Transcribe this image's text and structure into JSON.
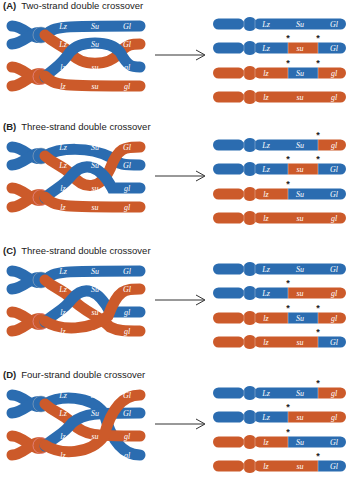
{
  "colors": {
    "blue": "#2b6cb0",
    "orange": "#cc5a2a",
    "arrow": "#333333"
  },
  "panels": [
    {
      "id": "A",
      "letter": "(A)",
      "title": "Two-strand double crossover",
      "top": 0,
      "products": [
        {
          "segments": [
            "blue",
            "blue",
            "blue"
          ],
          "labels": [
            "Lz",
            "Su",
            "Gl"
          ],
          "stars": []
        },
        {
          "segments": [
            "blue",
            "orange",
            "blue"
          ],
          "labels": [
            "Lz",
            "su",
            "Gl"
          ],
          "stars": [
            1,
            2
          ]
        },
        {
          "segments": [
            "orange",
            "blue",
            "orange"
          ],
          "labels": [
            "lz",
            "Su",
            "gl"
          ],
          "stars": [
            1,
            2
          ]
        },
        {
          "segments": [
            "orange",
            "orange",
            "orange"
          ],
          "labels": [
            "lz",
            "su",
            "gl"
          ],
          "stars": []
        }
      ]
    },
    {
      "id": "B",
      "letter": "(B)",
      "title": "Three-strand double crossover",
      "top": 121,
      "products": [
        {
          "segments": [
            "blue",
            "blue",
            "orange"
          ],
          "labels": [
            "Lz",
            "Su",
            "gl"
          ],
          "stars": [
            2
          ]
        },
        {
          "segments": [
            "blue",
            "orange",
            "blue"
          ],
          "labels": [
            "Lz",
            "su",
            "Gl"
          ],
          "stars": [
            1,
            2
          ]
        },
        {
          "segments": [
            "orange",
            "blue",
            "blue"
          ],
          "labels": [
            "lz",
            "Su",
            "Gl"
          ],
          "stars": [
            1
          ]
        },
        {
          "segments": [
            "orange",
            "orange",
            "orange"
          ],
          "labels": [
            "lz",
            "su",
            "gl"
          ],
          "stars": []
        }
      ]
    },
    {
      "id": "C",
      "letter": "(C)",
      "title": "Three-strand double crossover",
      "top": 245,
      "products": [
        {
          "segments": [
            "blue",
            "blue",
            "blue"
          ],
          "labels": [
            "Lz",
            "Su",
            "Gl"
          ],
          "stars": []
        },
        {
          "segments": [
            "blue",
            "orange",
            "orange"
          ],
          "labels": [
            "Lz",
            "su",
            "gl"
          ],
          "stars": [
            1
          ]
        },
        {
          "segments": [
            "orange",
            "blue",
            "orange"
          ],
          "labels": [
            "lz",
            "Su",
            "gl"
          ],
          "stars": [
            1,
            2
          ]
        },
        {
          "segments": [
            "orange",
            "orange",
            "blue"
          ],
          "labels": [
            "lz",
            "su",
            "Gl"
          ],
          "stars": [
            2
          ]
        }
      ]
    },
    {
      "id": "D",
      "letter": "(D)",
      "title": "Four-strand double crossover",
      "top": 369,
      "products": [
        {
          "segments": [
            "blue",
            "blue",
            "orange"
          ],
          "labels": [
            "Lz",
            "Su",
            "gl"
          ],
          "stars": [
            2
          ]
        },
        {
          "segments": [
            "blue",
            "orange",
            "orange"
          ],
          "labels": [
            "Lz",
            "su",
            "gl"
          ],
          "stars": [
            1
          ]
        },
        {
          "segments": [
            "orange",
            "blue",
            "blue"
          ],
          "labels": [
            "lz",
            "Su",
            "Gl"
          ],
          "stars": [
            1
          ]
        },
        {
          "segments": [
            "orange",
            "orange",
            "blue"
          ],
          "labels": [
            "lz",
            "su",
            "Gl"
          ],
          "stars": [
            2
          ]
        }
      ]
    }
  ],
  "parental": {
    "A": [
      [
        "Lz",
        "Su",
        "Gl"
      ],
      [
        "Lz",
        "Su",
        "Gl"
      ],
      [
        "lz",
        "su",
        "gl"
      ],
      [
        "lz",
        "su",
        "gl"
      ]
    ],
    "B": [
      [
        "Lz",
        "Su",
        "Gl"
      ],
      [
        "Lz",
        "Su",
        "Gl"
      ],
      [
        "lz",
        "su",
        "gl"
      ],
      [
        "lz",
        "su",
        "gl"
      ]
    ],
    "C": [
      [
        "Lz",
        "Su",
        "Gl"
      ],
      [
        "Lz",
        "Su",
        "Gl"
      ],
      [
        "lz",
        "su",
        "gl"
      ],
      [
        "lz",
        "su",
        "gl"
      ]
    ],
    "D": [
      [
        "Lz",
        "Su",
        "Gl"
      ],
      [
        "Lz",
        "Su",
        "Gl"
      ],
      [
        "lz",
        "su",
        "gl"
      ],
      [
        "lz",
        "su",
        "gl"
      ]
    ]
  },
  "star_glyph": "*"
}
